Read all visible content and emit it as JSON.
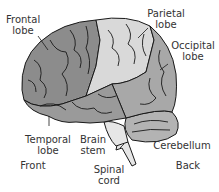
{
  "labels": {
    "frontal_lobe": [
      "Frontal",
      "lobe"
    ],
    "parietal_lobe": [
      "Parietal",
      "lobe"
    ],
    "occipital_lobe": [
      "Occipital",
      "lobe"
    ],
    "temporal_lobe": [
      "Temporal",
      "lobe"
    ],
    "brain_stem": [
      "Brain",
      "stem"
    ],
    "spinal_cord": [
      "Spinal",
      "cord"
    ],
    "cerebellum": "Cerebellum",
    "front": "Front",
    "back": "Back"
  },
  "colors": {
    "frontal": "#8c8c8c",
    "parietal": "#d9d9d9",
    "occipital": "#a8a8a8",
    "temporal": "#9a9a9a",
    "cerebellum": "#b3b3b3",
    "stem": "#e6e6e6",
    "outline": "#1a1a1a",
    "text": "#333333"
  }
}
